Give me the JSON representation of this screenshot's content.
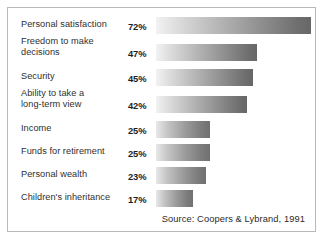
{
  "chart_data": {
    "type": "bar",
    "orientation": "horizontal",
    "title": "",
    "xlabel": "",
    "ylabel": "",
    "xlim": [
      0,
      80
    ],
    "grid": false,
    "legend": null,
    "value_suffix": "%",
    "categories": [
      "Personal satisfaction",
      "Freedom to make decisions",
      "Security",
      "Ability to take a long-term view",
      "Income",
      "Funds for retirement",
      "Personal wealth",
      "Children's inheritance"
    ],
    "values": [
      72,
      47,
      45,
      42,
      25,
      25,
      23,
      17
    ],
    "value_labels": [
      "72%",
      "47%",
      "45%",
      "42%",
      "25%",
      "25%",
      "23%",
      "17%"
    ],
    "source": "Source: Coopers & Lybrand, 1991"
  },
  "rows": [
    {
      "label": "Personal satisfaction",
      "value_label": "72%",
      "value": 72
    },
    {
      "label": "Freedom to make\ndecisions",
      "value_label": "47%",
      "value": 47
    },
    {
      "label": "Security",
      "value_label": "45%",
      "value": 45
    },
    {
      "label": "Ability to take a\nlong-term view",
      "value_label": "42%",
      "value": 42
    },
    {
      "label": "Income",
      "value_label": "25%",
      "value": 25
    },
    {
      "label": "Funds for retirement",
      "value_label": "25%",
      "value": 25
    },
    {
      "label": "Personal wealth",
      "value_label": "23%",
      "value": 23
    },
    {
      "label": "Children's inheritance",
      "value_label": "17%",
      "value": 17
    }
  ],
  "footer": {
    "source": "Source: Coopers & Lybrand, 1991"
  },
  "colors": {
    "bar_light": "#f2f2f2",
    "bar_dark": "#676767",
    "frame_border": "#b9b9b9",
    "label_text": "#2f2f2f",
    "value_text": "#1e1e1e",
    "background": "#ffffff"
  }
}
